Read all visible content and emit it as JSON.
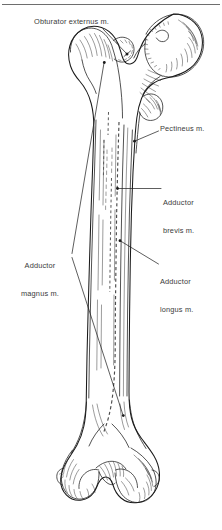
{
  "figure": {
    "name": "posterior-view-right-femur-muscle-attachments",
    "view": "posterior",
    "bone": "femur",
    "background_color": "#ffffff",
    "ink_color": "#1a1a1a",
    "label_color": "#3a3a3a",
    "rule_color": "#6e6e6e"
  },
  "labels": {
    "obturator_externus": "Obturator externus m.",
    "pectineus": "Pectineus m.",
    "adductor_brevis_line1": "Adductor",
    "adductor_brevis_line2": "brevis m.",
    "adductor_longus_line1": "Adductor",
    "adductor_longus_line2": "longus m.",
    "adductor_magnus_line1": "Adductor",
    "adductor_magnus_line2": "magnus m."
  }
}
